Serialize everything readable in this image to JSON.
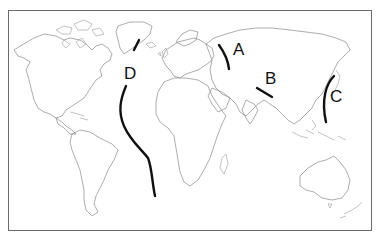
{
  "map": {
    "title": "World map with plate boundaries",
    "projection": "world outline map, Pacific-right (Atlantic centered)",
    "colors": {
      "outline": "#8a8a8a",
      "boundary": "#111111",
      "background": "#ffffff"
    },
    "boundaries": [
      {
        "label": "A",
        "location": "Ural Mountains region (between Europe and Asia)"
      },
      {
        "label": "B",
        "location": "Himalaya region (between India and Asia)"
      },
      {
        "label": "C",
        "location": "Western Pacific near Japan"
      },
      {
        "label": "D",
        "location": "Mid-Atlantic Ridge"
      }
    ]
  }
}
